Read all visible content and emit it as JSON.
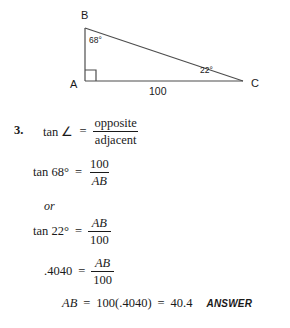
{
  "figure": {
    "name": "right-triangle-abc",
    "vertices": {
      "B": "B",
      "A": "A",
      "C": "C"
    },
    "angles": {
      "at_B": "68°",
      "at_C": "22°",
      "at_A": "right angle"
    },
    "sides": {
      "AC": "100"
    },
    "stroke_color": "#4d4d4d"
  },
  "solution": {
    "item_number": "3.",
    "definition": {
      "lhs": "tan ∠",
      "eq": "=",
      "numerator": "opposite",
      "denominator": "adjacent"
    },
    "step_tan68": {
      "lhs": "tan 68°",
      "eq": "=",
      "numerator": "100",
      "denominator": "AB"
    },
    "connector": "or",
    "step_tan22": {
      "lhs": "tan 22°",
      "eq": "=",
      "numerator": "AB",
      "denominator": "100"
    },
    "step_decimal": {
      "lhs": ".4040",
      "eq": "=",
      "numerator": "AB",
      "denominator": "100"
    },
    "final": {
      "lhs": "AB",
      "eq1": "=",
      "expr": "100(.4040)",
      "eq2": "=",
      "value": "40.4",
      "answer_tag": "ANSWER"
    }
  }
}
